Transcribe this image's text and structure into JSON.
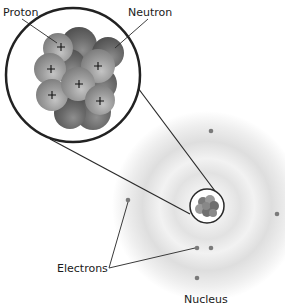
{
  "diagram": {
    "labels": {
      "proton": "Proton",
      "neutron": "Neutron",
      "electrons": "Electrons",
      "nucleus": "Nucleus"
    },
    "colors": {
      "line": "#2a2a2a",
      "proton": "#9a9a9a",
      "neutron": "#6e6e6e",
      "cloud": "#d9d9d9",
      "electron": "#7a7a7a"
    },
    "components": [
      "magnified nucleus",
      "nucleus",
      "electron cloud",
      "electrons"
    ],
    "proton_sign": "+"
  }
}
